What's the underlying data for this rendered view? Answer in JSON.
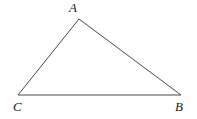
{
  "figure": {
    "kind": "geometry-diagram",
    "shape": "triangle",
    "background_color": "#ffffff",
    "stroke_color": "#4a4a4a",
    "stroke_width": 1,
    "label_color": "#1a1a1a",
    "width": 197,
    "height": 119,
    "vertices": [
      {
        "id": "A",
        "label": "A",
        "x": 79,
        "y": 19,
        "label_x": 69,
        "label_y": 1
      },
      {
        "id": "B",
        "label": "B",
        "x": 181,
        "y": 95,
        "label_x": 175,
        "label_y": 100
      },
      {
        "id": "C",
        "label": "C",
        "x": 18,
        "y": 95,
        "label_x": 13,
        "label_y": 100
      }
    ],
    "edges": [
      {
        "id": "CA",
        "from": "C",
        "to": "A"
      },
      {
        "id": "AB",
        "from": "A",
        "to": "B"
      },
      {
        "id": "BC",
        "from": "B",
        "to": "C"
      }
    ],
    "path": "M 18 95 L 79 19 L 181 95 Z"
  }
}
